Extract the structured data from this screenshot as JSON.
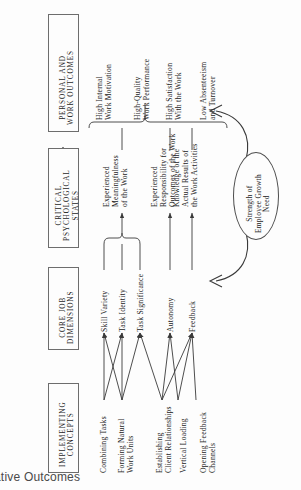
{
  "figure": {
    "caption_partial": "ative Outcomes",
    "orientation": "rotated-90-ccw",
    "line_color": "#3a3a3a",
    "box_border_color": "#6d6d6d",
    "background": "#fdfdfd"
  },
  "columns": [
    {
      "id": "implementing",
      "title": "IMPLEMENTING\nCONCEPTS",
      "title_line1": "IMPLEMENTING",
      "title_line2": "CONCEPTS"
    },
    {
      "id": "core_job",
      "title_line1": "CORE JOB",
      "title_line2": "DIMENSIONS"
    },
    {
      "id": "psych_states",
      "title_line1": "CRITICAL",
      "title_line2": "PSYCHOLOGICAL",
      "title_line3": "STATES"
    },
    {
      "id": "outcomes",
      "title_line1": "PERSONAL AND",
      "title_line2": "WORK OUTCOMES"
    }
  ],
  "implementing_concepts": [
    {
      "id": "combining-tasks",
      "line1": "Combining Tasks",
      "line2": ""
    },
    {
      "id": "forming-natural-work-units",
      "line1": "Forming Natural",
      "line2": "Work Units"
    },
    {
      "id": "establishing-client-relationships",
      "line1": "Establishing",
      "line2": "Client Relationships"
    },
    {
      "id": "vertical-loading",
      "line1": "Vertical Loading",
      "line2": ""
    },
    {
      "id": "opening-feedback-channels",
      "line1": "Opening Feedback",
      "line2": "Channels"
    }
  ],
  "core_job_dimensions": [
    {
      "id": "skill-variety",
      "line1": "Skill Variety",
      "line2": ""
    },
    {
      "id": "task-identity",
      "line1": "Task Identity",
      "line2": ""
    },
    {
      "id": "task-significance",
      "line1": "Task Significance",
      "line2": ""
    },
    {
      "id": "autonomy",
      "line1": "Autonomy",
      "line2": ""
    },
    {
      "id": "feedback",
      "line1": "Feedback",
      "line2": ""
    }
  ],
  "critical_psychological_states": [
    {
      "id": "experienced-meaningfulness",
      "line1": "Experienced",
      "line2": "Meaningfulness",
      "line3": "of the Work"
    },
    {
      "id": "experienced-responsibility",
      "line1": "Experienced",
      "line2": "Responsibility for",
      "line3": "Outcomes of the Work"
    },
    {
      "id": "knowledge-of-results",
      "line1": "Knowledge of the",
      "line2": "Actual Results of",
      "line3": "the Work Activities"
    }
  ],
  "personal_and_work_outcomes": [
    {
      "id": "high-internal-work-motivation",
      "line1": "High Internal",
      "line2": "Work Motivation"
    },
    {
      "id": "high-quality-work-performance",
      "line1": "High-Quality",
      "line2": "Work Performance"
    },
    {
      "id": "high-satisfaction-with-the-work",
      "line1": "High Satisfaction",
      "line2": "With the Work"
    },
    {
      "id": "low-absenteeism-and-turnover",
      "line1": "Low Absenteeism",
      "line2": "and Turnover"
    }
  ],
  "moderator": {
    "id": "employee-growth-need",
    "line1": "Strength of",
    "line2": "Employee Growth",
    "line3": "Need"
  }
}
